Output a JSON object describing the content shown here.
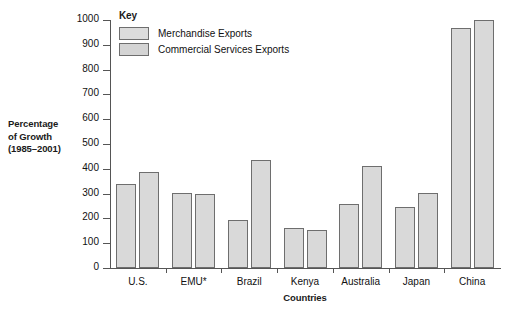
{
  "chart_data": {
    "type": "bar",
    "title": "",
    "xlabel": "Countries",
    "ylabel": "Percentage of Growth (1985–2001)",
    "ylabel_lines": [
      "Percentage",
      "of Growth",
      "(1985–2001)"
    ],
    "categories": [
      "U.S.",
      "EMU*",
      "Brazil",
      "Kenya",
      "Australia",
      "Japan",
      "China"
    ],
    "series": [
      {
        "name": "Merchandise Exports",
        "values": [
          340,
          302,
          195,
          160,
          258,
          247,
          968
        ]
      },
      {
        "name": "Commercial Services Exports",
        "values": [
          386,
          300,
          434,
          155,
          413,
          303,
          1000
        ]
      }
    ],
    "ylim": [
      0,
      1000
    ],
    "yticks": [
      0,
      100,
      200,
      300,
      400,
      500,
      600,
      700,
      800,
      900,
      1000
    ],
    "ytick_labels": [
      "0",
      "100",
      "200",
      "300",
      "400",
      "500",
      "600",
      "700",
      "800",
      "900",
      "1000"
    ],
    "grid": false,
    "legend_position": "top-left-inside",
    "bar_fill_color": "#d9d9d9",
    "bar_border_color": "#6e6e6e",
    "axis_color": "#555555"
  },
  "legend": {
    "title": "Key",
    "entries": [
      {
        "label": "Merchandise Exports",
        "swatch": "legend-swatch-merchandise"
      },
      {
        "label": "Commercial Services Exports",
        "swatch": "legend-swatch-commercial"
      }
    ]
  }
}
